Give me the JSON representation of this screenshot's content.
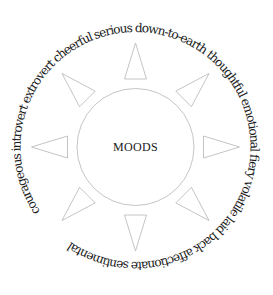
{
  "diagram": {
    "center_label": "MOODS",
    "moods": [
      "courageous",
      "introvert",
      "extrovert",
      "cheerful",
      "serious",
      "down-to-earth",
      "thoughtful",
      "emotional",
      "fiery",
      "volatile",
      "laid back",
      "affectionate",
      "sentimental"
    ],
    "ray_count": 8,
    "colors": {
      "text": "#1a1a1a",
      "outline": "#b5b5b5",
      "background": "#ffffff"
    }
  }
}
